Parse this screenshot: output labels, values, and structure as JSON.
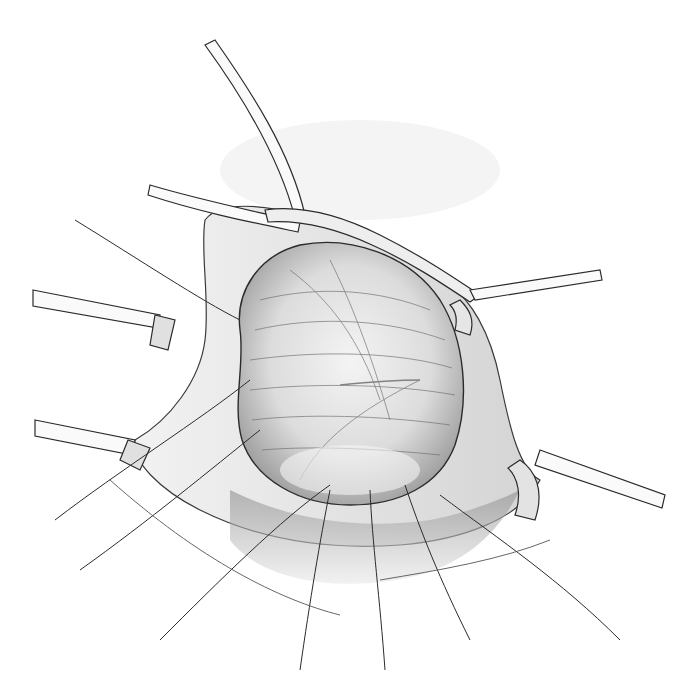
{
  "illustration": {
    "kind": "pencil surgical illustration",
    "subject": "retracted incision exposing an oval organ/mass with fibrous striations, held open by retractor blades and stay sutures",
    "palette": {
      "background": "#ffffff",
      "line": "#2b2b2b",
      "shade_dark": "#8a8a8a",
      "shade_mid": "#bdbdbd",
      "shade_light": "#e6e6e6"
    },
    "retractors": [
      "top-left",
      "top-right",
      "left-upper",
      "left-lower",
      "right-lower"
    ],
    "suture_count_bottom": 6
  }
}
